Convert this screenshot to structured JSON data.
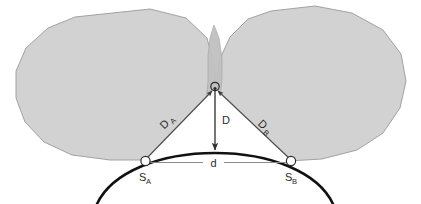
{
  "figure": {
    "background_color": "#ffffff"
  },
  "colors": {
    "blob_fill": "#d2d2d2",
    "blob_stroke": "#9a9a9a",
    "overlap_fill": "#bdbdbd",
    "wedge_fill": "#ffffff",
    "earth_arc_stroke": "#111111",
    "measure_line_stroke": "#8c8c8c",
    "leader_line_stroke": "#4a4a4a",
    "label_color": "#2b2b2b",
    "station_marker_stroke": "#2b2b2b",
    "apex_marker_stroke": "#2b2b2b"
  },
  "labels": {
    "distance_a": {
      "text": "D",
      "subscript": "A"
    },
    "distance_b": {
      "text": "D",
      "subscript": "B"
    },
    "altitude": {
      "text": "D",
      "subscript": ""
    },
    "baseline": {
      "text": "d",
      "subscript": ""
    },
    "station_a": {
      "text": "S",
      "subscript": "A"
    },
    "station_b": {
      "text": "S",
      "subscript": "B"
    }
  },
  "geometry": {
    "apex_point": {
      "x": 215,
      "y": 88
    },
    "station_a_point": {
      "x": 145,
      "y": 161
    },
    "station_b_point": {
      "x": 291,
      "y": 161
    },
    "altitude_foot": {
      "x": 215,
      "y": 155
    },
    "baseline_y": 163,
    "marker_radius": 4.5,
    "apex_marker_radius": 4.0
  }
}
